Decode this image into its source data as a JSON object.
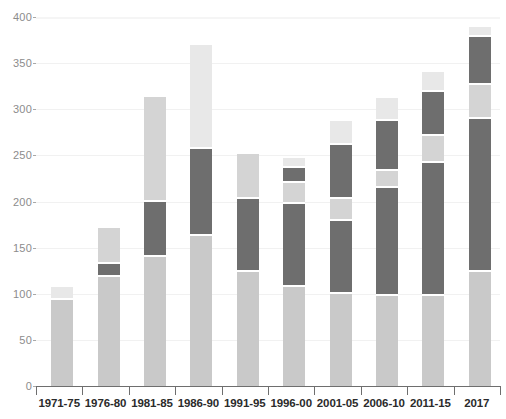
{
  "chart_data": {
    "type": "bar",
    "subtype": "stacked-bar",
    "title": "",
    "subtitle": "",
    "xlabel": "",
    "ylabel": "",
    "ylim": [
      0,
      400
    ],
    "yticks": [
      0,
      50,
      100,
      150,
      200,
      250,
      300,
      350,
      400
    ],
    "ytick_labels": [
      "0",
      "50",
      "100",
      "150",
      "200",
      "250",
      "300",
      "350",
      "400"
    ],
    "grid": true,
    "legend": "none",
    "categories": [
      "1971-75",
      "1976-80",
      "1981-85",
      "1986-90",
      "1991-95",
      "1996-00",
      "2001-05",
      "2006-10",
      "2011-15",
      "2017"
    ],
    "series": [
      {
        "name": "segment-1",
        "color": "#c9c9c9",
        "values": [
          93,
          118,
          140,
          163,
          124,
          107,
          100,
          98,
          98,
          124
        ]
      },
      {
        "name": "segment-2",
        "color": "#6e6e6e",
        "values": [
          0,
          12,
          57,
          92,
          77,
          88,
          77,
          114,
          142,
          163
        ]
      },
      {
        "name": "segment-3",
        "color": "#d4d4d4",
        "values": [
          0,
          37,
          112,
          0,
          46,
          21,
          21,
          17,
          27,
          35
        ]
      },
      {
        "name": "segment-4",
        "color": "#6e6e6e",
        "values": [
          0,
          0,
          0,
          0,
          0,
          14,
          57,
          52,
          45,
          50
        ]
      },
      {
        "name": "segment-5",
        "color": "#e8e8e8",
        "values": [
          12,
          0,
          0,
          110,
          0,
          8,
          24,
          23,
          20,
          8
        ]
      }
    ],
    "totals": [
      105,
      167,
      309,
      365,
      247,
      238,
      279,
      304,
      332,
      380
    ],
    "bar_tops": [
      105,
      167,
      309,
      365,
      247,
      238,
      279,
      304,
      332,
      380
    ],
    "segment_boundaries": [
      [
        0,
        93,
        105
      ],
      [
        0,
        118,
        130,
        167
      ],
      [
        0,
        140,
        197,
        309
      ],
      [
        0,
        163,
        255,
        365
      ],
      [
        0,
        124,
        201,
        247
      ],
      [
        0,
        107,
        195,
        216,
        230,
        238
      ],
      [
        0,
        100,
        177,
        198,
        255,
        279
      ],
      [
        0,
        98,
        212,
        229,
        281,
        304
      ],
      [
        0,
        98,
        240,
        267,
        312,
        332
      ],
      [
        0,
        124,
        287,
        322,
        372,
        380
      ]
    ]
  },
  "axes": {
    "y_ticks": [
      "400",
      "350",
      "300",
      "250",
      "200",
      "150",
      "100",
      "50",
      "0"
    ],
    "x_ticks": [
      "1971-75",
      "1976-80",
      "1981-85",
      "1986-90",
      "1991-95",
      "1996-00",
      "2001-05",
      "2006-10",
      "2011-15",
      "2017"
    ]
  },
  "colors": {
    "segment_1": "#c9c9c9",
    "segment_2": "#6e6e6e",
    "segment_3": "#d4d4d4",
    "segment_4": "#6e6e6e",
    "segment_5": "#e8e8e8",
    "grid": "#f1f1f1",
    "axis": "#6e6e6e",
    "tick_label": "#8c8c8c",
    "category_label": "#2b2b2b",
    "background": "#ffffff"
  }
}
